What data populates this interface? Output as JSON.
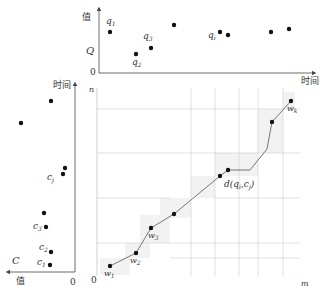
{
  "top_chart": {
    "y_axis_label": "值",
    "y_tick_label": "Q",
    "origin_label": "0",
    "x_axis_label": "时间",
    "point_labels": {
      "q1": {
        "base": "q",
        "sub": "1"
      },
      "q2": {
        "base": "q",
        "sub": "2"
      },
      "q3": {
        "base": "q",
        "sub": "3"
      },
      "qi": {
        "base": "q",
        "sub": "i"
      }
    },
    "points": [
      [
        110,
        32
      ],
      [
        136,
        54
      ],
      [
        151,
        48
      ],
      [
        174,
        25
      ],
      [
        220,
        32
      ],
      [
        228,
        35
      ],
      [
        271,
        32
      ],
      [
        289,
        29
      ]
    ]
  },
  "left_chart": {
    "y_axis_label": "时间",
    "x_axis_label": "值",
    "series_label": "C",
    "origin_label": "0",
    "point_labels": {
      "c1": {
        "base": "c",
        "sub": "1"
      },
      "c2": {
        "base": "c",
        "sub": "2"
      },
      "c3": {
        "base": "c",
        "sub": "3"
      },
      "cj": {
        "base": "c",
        "sub": "j"
      }
    },
    "points": [
      [
        51,
        101
      ],
      [
        21,
        123
      ],
      [
        65,
        168
      ],
      [
        63,
        174
      ],
      [
        44,
        213
      ],
      [
        46,
        227
      ],
      [
        51,
        252
      ],
      [
        50,
        265
      ]
    ]
  },
  "main_chart": {
    "y_axis_label": "n",
    "x_axis_label": "m",
    "origin_label": "0",
    "distance_label": {
      "prefix": "d(",
      "q": "q",
      "qsub": "i",
      "sep": ",",
      "c": "c",
      "csub": "j",
      "suffix": ")"
    },
    "path_labels": {
      "w1": {
        "base": "w",
        "sub": "1"
      },
      "w2": {
        "base": "w",
        "sub": "2"
      },
      "w3": {
        "base": "w",
        "sub": "3"
      },
      "wk": {
        "base": "w",
        "sub": "k"
      }
    },
    "path_points": [
      [
        110,
        266
      ],
      [
        136,
        253
      ],
      [
        151,
        228
      ],
      [
        174,
        214
      ],
      [
        220,
        176
      ],
      [
        228,
        170
      ],
      [
        250,
        170
      ],
      [
        267,
        149
      ],
      [
        272,
        122
      ],
      [
        291,
        101
      ]
    ],
    "marker_points": [
      [
        110,
        266
      ],
      [
        136,
        253
      ],
      [
        151,
        228
      ],
      [
        174,
        214
      ],
      [
        220,
        176
      ],
      [
        228,
        170
      ],
      [
        272,
        122
      ],
      [
        291,
        101
      ]
    ]
  },
  "colors": {
    "axis": "#444444",
    "grid": "#c8c8c8",
    "path": "#777777",
    "point": "#111111",
    "shade": "#f1f1f1"
  }
}
